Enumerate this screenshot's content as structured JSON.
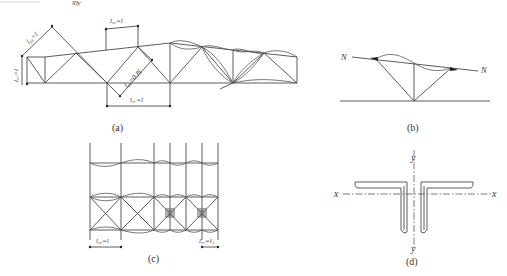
{
  "figure": {
    "top_fragment": "l0y",
    "panels": {
      "a": {
        "caption": "(a)",
        "labels": {
          "l_ox_diag": "l₀ₓ=l",
          "l_ox_vert": "l₀ₓ=l",
          "l_oy_top": "l₀ᵧ=l",
          "l_ox_08": "l₀ₓ=0.8l",
          "l_ox_bottom": "l₀ₓ=l"
        }
      },
      "b": {
        "caption": "(b)",
        "force_left": "N",
        "force_right": "N"
      },
      "c": {
        "caption": "(c)",
        "label_left": "l₀ᵧ=l",
        "label_right": "l₀ᵧ=l₁"
      },
      "d": {
        "caption": "(d)",
        "axis_x_left": "x",
        "axis_x_right": "x",
        "axis_y_top": "y",
        "axis_y_bottom": "y"
      }
    },
    "colors": {
      "line": "#4a4a4a",
      "text": "#333333",
      "background": "#ffffff"
    }
  }
}
